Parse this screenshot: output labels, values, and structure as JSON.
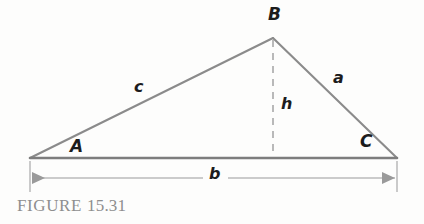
{
  "figure": {
    "caption_prefix": "FIGURE",
    "caption_number": "15.31",
    "background_color": "#fdfdfc",
    "line_color": "#8b8b8b",
    "base_line_color": "#7d7d7d",
    "dimension_line_color": "#9a9a9a",
    "label_color": "#1c1c1c",
    "caption_color": "#8e8e8e"
  },
  "diagram": {
    "type": "triangle-with-altitude",
    "vertices": {
      "A": {
        "label": "A",
        "x": 30,
        "y": 158
      },
      "B": {
        "label": "B",
        "x": 273,
        "y": 38
      },
      "C": {
        "label": "C",
        "x": 397,
        "y": 158
      }
    },
    "sides": {
      "a": {
        "label": "a",
        "from": "B",
        "to": "C"
      },
      "b": {
        "label": "b",
        "from": "A",
        "to": "C"
      },
      "c": {
        "label": "c",
        "from": "A",
        "to": "B"
      }
    },
    "altitude": {
      "label": "h",
      "from": "B",
      "foot_x": 273,
      "foot_y": 158,
      "style": "dashed"
    },
    "dimension": {
      "label": "b",
      "axis": "horizontal",
      "y": 178,
      "x_start": 30,
      "x_end": 397,
      "arrowheads": "both"
    }
  }
}
